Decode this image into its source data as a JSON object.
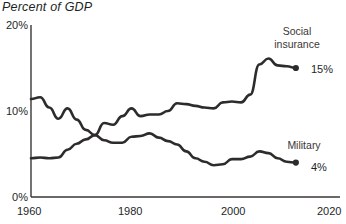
{
  "chart_data": {
    "type": "line",
    "title": "Percent of GDP",
    "xlabel": "",
    "ylabel": "",
    "xlim": [
      1960,
      2020
    ],
    "ylim": [
      0,
      20
    ],
    "grid": false,
    "legend_position": "inline-right",
    "x_ticks": [
      "1960",
      "1980",
      "2000",
      "2020"
    ],
    "x_tick_values": [
      1960,
      1980,
      2000,
      2020
    ],
    "y_ticks": [
      "0%",
      "10%",
      "20%"
    ],
    "y_tick_values": [
      0,
      10,
      20
    ],
    "series": [
      {
        "name": "Social insurance",
        "label_line1": "Social",
        "label_line2": "insurance",
        "end_value_label": "15%",
        "end_value": 15,
        "color": "#2e2b2b",
        "x": [
          1960,
          1962,
          1964,
          1966,
          1968,
          1970,
          1972,
          1974,
          1976,
          1978,
          1980,
          1982,
          1984,
          1986,
          1988,
          1990,
          1992,
          1994,
          1996,
          1998,
          2000,
          2002,
          2004,
          2006,
          2008,
          2010,
          2012,
          2014,
          2016,
          2018
        ],
        "values": [
          4.5,
          4.6,
          4.5,
          4.6,
          5.5,
          6.2,
          6.7,
          7.2,
          8.6,
          8.4,
          9.4,
          10.3,
          9.4,
          9.6,
          9.6,
          10.0,
          10.9,
          10.8,
          10.6,
          10.4,
          10.3,
          11.0,
          11.1,
          11.0,
          11.9,
          15.4,
          16.1,
          15.3,
          15.2,
          15.0
        ]
      },
      {
        "name": "Military",
        "label_line1": "Military",
        "label_line2": "",
        "end_value_label": "4%",
        "end_value": 4,
        "color": "#2e2b2b",
        "x": [
          1960,
          1962,
          1964,
          1966,
          1968,
          1970,
          1972,
          1974,
          1976,
          1978,
          1980,
          1982,
          1984,
          1986,
          1988,
          1990,
          1992,
          1994,
          1996,
          1998,
          2000,
          2002,
          2004,
          2006,
          2008,
          2010,
          2012,
          2014,
          2016,
          2018
        ],
        "values": [
          11.4,
          11.6,
          10.4,
          9.1,
          10.3,
          9.0,
          7.8,
          7.2,
          6.6,
          6.3,
          6.3,
          7.0,
          7.1,
          7.4,
          6.9,
          6.5,
          6.1,
          5.3,
          4.5,
          4.1,
          3.7,
          3.8,
          4.4,
          4.4,
          4.7,
          5.3,
          5.1,
          4.5,
          4.1,
          4.0
        ]
      }
    ]
  }
}
